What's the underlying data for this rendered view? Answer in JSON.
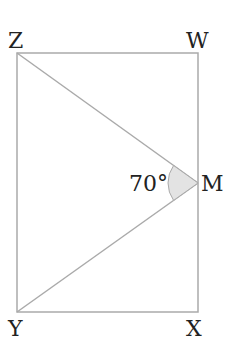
{
  "diagram": {
    "type": "geometry",
    "shape": "rectangle WXYZ with point M on side WX, segments ZM and YM",
    "vertices": {
      "Z": "Z",
      "W": "W",
      "Y": "Y",
      "X": "X",
      "M": "M"
    },
    "angle": {
      "at": "M",
      "between": "ZM and YM",
      "label": "70°"
    },
    "colors": {
      "line": "#aaaaaa",
      "text": "#222222",
      "angle_fill": "#e3e3e3"
    }
  }
}
